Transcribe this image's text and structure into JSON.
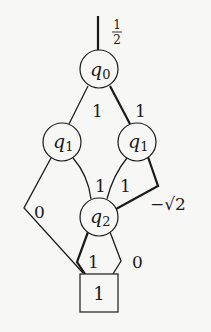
{
  "diagram": {
    "root_weight": {
      "num": "1",
      "den": "2"
    },
    "nodes": {
      "q0": {
        "var": "q",
        "sub": "0"
      },
      "q1_left": {
        "var": "q",
        "sub": "1"
      },
      "q1_right": {
        "var": "q",
        "sub": "1"
      },
      "q2": {
        "var": "q",
        "sub": "2"
      },
      "terminal": {
        "label": "1"
      }
    },
    "edges": {
      "q0_to_q1_left": "1",
      "q0_to_q1_right": "1",
      "q1_left_to_q2": "1",
      "q1_left_to_terminal": "0",
      "q1_right_to_q2": "1",
      "q1_right_to_q2_alt": "−√2",
      "q2_to_terminal_left": "1",
      "q2_to_terminal_right": "0"
    },
    "colors": {
      "stroke": "#1a1a1a",
      "background": "#f7f7f5"
    }
  }
}
